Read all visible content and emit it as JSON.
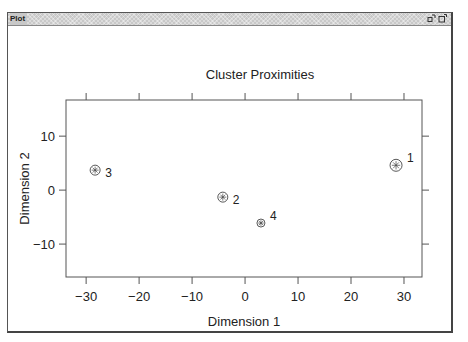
{
  "window": {
    "title": "Plot",
    "buttons": [
      {
        "name": "restore-button",
        "icon": "restore-icon"
      },
      {
        "name": "maximize-button",
        "icon": "maximize-icon"
      }
    ]
  },
  "chart_data": {
    "type": "scatter",
    "title": "Cluster Proximities",
    "xlabel": "Dimension 1",
    "ylabel": "Dimension 2",
    "xlim": [
      -33.8,
      33.4
    ],
    "ylim": [
      -16.1,
      16.7
    ],
    "xticks": [
      -30,
      -20,
      -10,
      0,
      10,
      20,
      30
    ],
    "xtick_labels": [
      "−30",
      "−20",
      "−10",
      "0",
      "10",
      "20",
      "30"
    ],
    "yticks": [
      10,
      0,
      -10
    ],
    "ytick_labels": [
      "10",
      "0",
      "−10"
    ],
    "grid": false,
    "legend": null,
    "marker": "circled-asterisk",
    "points": [
      {
        "label": "1",
        "x": 28.5,
        "y": 4.6,
        "size": 6
      },
      {
        "label": "2",
        "x": -4.2,
        "y": -1.3,
        "size": 5
      },
      {
        "label": "3",
        "x": -28.3,
        "y": 3.7,
        "size": 5
      },
      {
        "label": "4",
        "x": 3.0,
        "y": -6.1,
        "size": 4
      }
    ]
  }
}
